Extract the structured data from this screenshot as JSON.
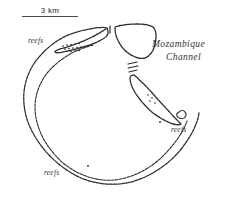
{
  "figure": {
    "type": "map",
    "background_color": "#ffffff",
    "ink_color": "#2b2b2b",
    "width_px": 229,
    "height_px": 197
  },
  "scalebar": {
    "label": "3 km",
    "length_px": 56,
    "distance_value": 3,
    "distance_unit": "km"
  },
  "labels": {
    "sea_line_1": "Mozambique",
    "sea_line_2": "Channel",
    "reefs_northwest": "reefs",
    "reefs_east": "reefs",
    "reefs_southwest": "reefs"
  },
  "features": {
    "outer_reef_name": "outer-reef-edge",
    "inner_lagoon_name": "inner-lagoon-edge",
    "island_north_name": "north-island",
    "island_northeast_name": "northeast-island",
    "islet_southeast_name": "southeast-islet",
    "pass_name": "channel-pass",
    "reef_patch_name": "reef-patch-stipple"
  }
}
